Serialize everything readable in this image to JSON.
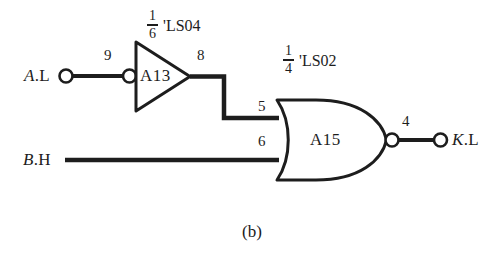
{
  "figure": {
    "caption": "(b)",
    "background_color": "#ffffff",
    "ink_color": "#1d1d1d"
  },
  "chips": [
    {
      "id": "ls04",
      "fraction_numerator": "1",
      "fraction_denominator": "6",
      "part_label": "'LS04"
    },
    {
      "id": "ls02",
      "fraction_numerator": "1",
      "fraction_denominator": "4",
      "part_label": "'LS02"
    }
  ],
  "gates": [
    {
      "id": "inverter",
      "type": "inverter",
      "name": "A13",
      "input_pin": "9",
      "output_pin": "8"
    },
    {
      "id": "nor",
      "type": "nor",
      "name": "A15",
      "input_pin_top": "5",
      "input_pin_bottom": "6",
      "output_pin": "4"
    }
  ],
  "signals": {
    "input_a": {
      "name": "A",
      "suffix": ".L",
      "full": "A.L"
    },
    "input_b": {
      "name": "B",
      "suffix": ".H",
      "full": "B.H"
    },
    "output_k": {
      "name": "K",
      "suffix": ".L",
      "full": "K.L"
    }
  }
}
